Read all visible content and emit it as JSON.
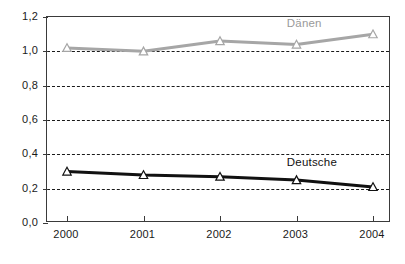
{
  "chart_data": {
    "type": "line",
    "title": "",
    "xlabel": "",
    "ylabel": "",
    "categories": [
      "2000",
      "2001",
      "2002",
      "2003",
      "2004"
    ],
    "ylim": [
      0.0,
      1.2
    ],
    "ytick_labels": [
      "0,0",
      "0,2",
      "0,4",
      "0,6",
      "0,8",
      "1,0",
      "1,2"
    ],
    "ytick_values": [
      0.0,
      0.2,
      0.4,
      0.6,
      0.8,
      1.0,
      1.2
    ],
    "grid": "horizontal-dashed",
    "gridline_values": [
      0.2,
      0.4,
      0.6,
      0.8,
      1.0
    ],
    "legend_position": "inline-labels",
    "series": [
      {
        "name": "Dänen",
        "color": "#a6a6a6",
        "marker": "triangle",
        "values": [
          1.02,
          1.0,
          1.06,
          1.04,
          1.1
        ],
        "label_x_pct": 70,
        "label_y_value": 1.155
      },
      {
        "name": "Deutsche",
        "color": "#111111",
        "marker": "triangle",
        "values": [
          0.3,
          0.28,
          0.27,
          0.25,
          0.21
        ],
        "label_x_pct": 70,
        "label_y_value": 0.345
      }
    ]
  },
  "axis": {
    "y_labels": [
      "1,2",
      "1,0",
      "0,8",
      "0,6",
      "0,4",
      "0,2",
      "0,0"
    ],
    "x_labels": [
      "2000",
      "2001",
      "2002",
      "2003",
      "2004"
    ]
  },
  "labels": {
    "danen": "Dänen",
    "deutsche": "Deutsche"
  },
  "colors": {
    "danen": "#a6a6a6",
    "deutsche": "#111111",
    "frame": "#3a3a3a",
    "grid": "#1a1a1a",
    "background": "#ffffff"
  }
}
